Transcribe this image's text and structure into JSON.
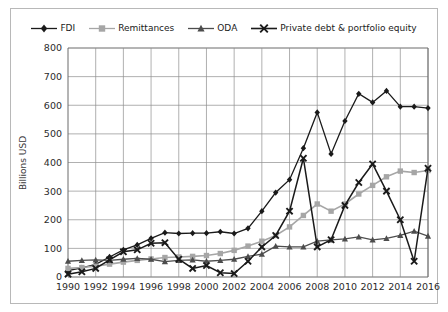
{
  "chart_data": {
    "type": "line",
    "title": "",
    "xlabel": "",
    "ylabel": "Billions USD",
    "ylim": [
      0,
      800
    ],
    "ytick_step": 100,
    "yticks": [
      "0",
      "100",
      "200",
      "300",
      "400",
      "500",
      "600",
      "700",
      "800"
    ],
    "xlim": [
      1990,
      2016
    ],
    "x": [
      1990,
      1991,
      1992,
      1993,
      1994,
      1995,
      1996,
      1997,
      1998,
      1999,
      2000,
      2001,
      2002,
      2003,
      2004,
      2005,
      2006,
      2007,
      2008,
      2009,
      2010,
      2011,
      2012,
      2013,
      2014,
      2015,
      2016
    ],
    "xticks": [
      "1990",
      "1992",
      "1994",
      "1996",
      "1998",
      "2000",
      "2002",
      "2004",
      "2006",
      "2008",
      "2010",
      "2012",
      "2014",
      "2016"
    ],
    "xtick_values": [
      1990,
      1992,
      1994,
      1996,
      1998,
      2000,
      2002,
      2004,
      2006,
      2008,
      2010,
      2012,
      2014,
      2016
    ],
    "grid": true,
    "grid_axis": "both",
    "legend_position": "top",
    "series": [
      {
        "name": "FDI",
        "marker": "diamond",
        "color": "#1a1a1a",
        "values": [
          22,
          32,
          44,
          70,
          95,
          112,
          135,
          155,
          152,
          153,
          153,
          158,
          152,
          170,
          230,
          295,
          340,
          450,
          575,
          430,
          545,
          640,
          610,
          650,
          595,
          595,
          590
        ]
      },
      {
        "name": "Remittances",
        "marker": "square",
        "color": "#a6a6a6",
        "values": [
          30,
          33,
          38,
          45,
          52,
          58,
          63,
          68,
          70,
          72,
          75,
          82,
          93,
          108,
          125,
          145,
          175,
          215,
          255,
          230,
          255,
          290,
          320,
          350,
          370,
          365,
          372
        ]
      },
      {
        "name": "ODA",
        "marker": "triangle",
        "color": "#4d4d4d",
        "values": [
          55,
          58,
          60,
          58,
          62,
          65,
          62,
          54,
          58,
          60,
          55,
          58,
          62,
          72,
          80,
          108,
          105,
          105,
          125,
          130,
          133,
          140,
          130,
          135,
          145,
          160,
          143
        ]
      },
      {
        "name": "Private debt & portfolio equity",
        "marker": "cross",
        "color": "#1a1a1a",
        "values": [
          10,
          18,
          30,
          60,
          88,
          95,
          118,
          120,
          62,
          30,
          40,
          15,
          12,
          55,
          105,
          145,
          230,
          415,
          105,
          130,
          250,
          330,
          395,
          300,
          200,
          55,
          380
        ]
      }
    ]
  },
  "legend": {
    "items": [
      {
        "label": "FDI"
      },
      {
        "label": "Remittances"
      },
      {
        "label": "ODA"
      },
      {
        "label": "Private debt & portfolio equity"
      }
    ]
  },
  "axes": {
    "y_axis_title": "Billions USD"
  },
  "colors": {
    "fdi": "#1a1a1a",
    "remittances": "#a6a6a6",
    "oda": "#4d4d4d",
    "private_debt": "#1a1a1a",
    "grid": "#8e8e8e",
    "frame": "#b8b8b8",
    "background": "#ffffff"
  }
}
